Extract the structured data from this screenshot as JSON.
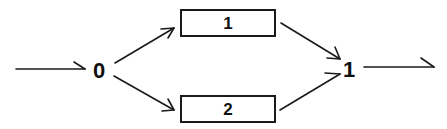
{
  "diagram": {
    "type": "flow-graph",
    "nodes": {
      "start": {
        "label": "0"
      },
      "box_top": {
        "label": "1"
      },
      "box_bottom": {
        "label": "2"
      },
      "end": {
        "label": "1"
      }
    },
    "edges": [
      {
        "from": "input",
        "to": "start"
      },
      {
        "from": "start",
        "to": "box_top"
      },
      {
        "from": "start",
        "to": "box_bottom"
      },
      {
        "from": "box_top",
        "to": "end"
      },
      {
        "from": "box_bottom",
        "to": "end"
      },
      {
        "from": "end",
        "to": "output"
      }
    ],
    "colors": {
      "stroke": "#1a1a1a",
      "text": "#111111",
      "background": "#ffffff"
    }
  }
}
